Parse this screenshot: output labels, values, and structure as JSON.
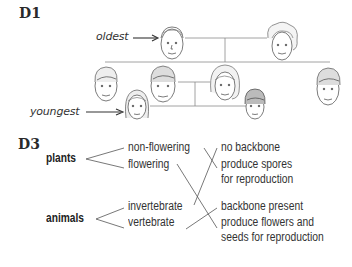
{
  "section_d1": {
    "heading": "D1",
    "labels": {
      "oldest": "oldest",
      "youngest": "youngest"
    },
    "family_tree": {
      "generation_1": [
        "grandfather-face",
        "grandmother-face"
      ],
      "generation_2": [
        "man-face-left",
        "man-face-middle",
        "woman-face",
        "man-face-right"
      ],
      "generation_3": [
        "girl-face",
        "boy-face"
      ]
    }
  },
  "section_d3": {
    "heading": "D3",
    "categories": [
      {
        "name": "plants",
        "branches": [
          "non-flowering",
          "flowering"
        ]
      },
      {
        "name": "animals",
        "branches": [
          "invertebrate",
          "vertebrate"
        ]
      }
    ],
    "descriptions": [
      {
        "line1": "no backbone",
        "line2": ""
      },
      {
        "line1": "produce spores",
        "line2": "for reproduction"
      },
      {
        "line1": "backbone present",
        "line2": ""
      },
      {
        "line1": "produce flowers and",
        "line2": "seeds for reproduction"
      }
    ],
    "matches": [
      {
        "from": "non-flowering",
        "to": "produce spores for reproduction"
      },
      {
        "from": "flowering",
        "to": "produce flowers and seeds for reproduction"
      },
      {
        "from": "invertebrate",
        "to": "no backbone"
      },
      {
        "from": "vertebrate",
        "to": "backbone present"
      }
    ],
    "line_color": "#555555"
  }
}
